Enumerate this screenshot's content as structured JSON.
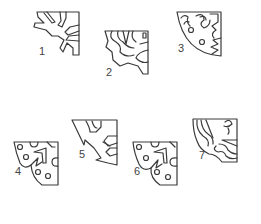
{
  "figure": {
    "stroke_color": "#3a3a3a",
    "background": "#ffffff",
    "items": [
      {
        "label": "1",
        "x": 39,
        "y": 52
      },
      {
        "label": "2",
        "x": 106,
        "y": 72
      },
      {
        "label": "3",
        "x": 178,
        "y": 48
      },
      {
        "label": "4",
        "x": 15,
        "y": 172
      },
      {
        "label": "5",
        "x": 79,
        "y": 154
      },
      {
        "label": "6",
        "x": 134,
        "y": 172
      },
      {
        "label": "7",
        "x": 199,
        "y": 155
      }
    ]
  }
}
